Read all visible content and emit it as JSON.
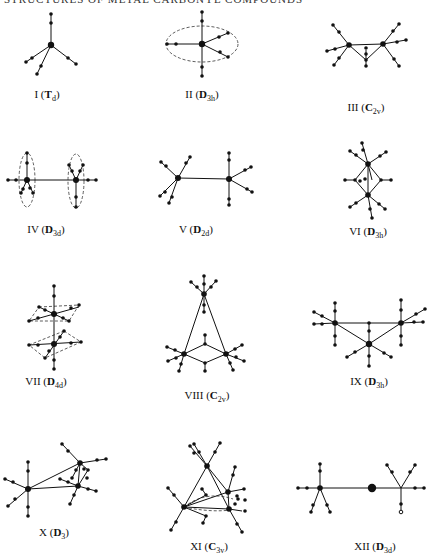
{
  "header": {
    "text": "STRUCTURES OF METAL CARBONYL COMPOUNDS"
  },
  "structures": [
    {
      "id": "I",
      "numeral": "I",
      "group": "T",
      "group_sub": "d",
      "group_bold": true,
      "cx": 47,
      "cy": 95
    },
    {
      "id": "II",
      "numeral": "II",
      "group": "D",
      "group_sub": "3h",
      "group_bold": true,
      "cx": 202,
      "cy": 95
    },
    {
      "id": "III",
      "numeral": "III",
      "group": "C",
      "group_sub": "2v",
      "group_bold": true,
      "cx": 366,
      "cy": 108
    },
    {
      "id": "IV",
      "numeral": "IV",
      "group": "D",
      "group_sub": "3d",
      "group_bold": true,
      "cx": 46,
      "cy": 230
    },
    {
      "id": "V",
      "numeral": "V",
      "group": "D",
      "group_sub": "2d",
      "group_bold": true,
      "cx": 196,
      "cy": 230
    },
    {
      "id": "VI",
      "numeral": "VI",
      "group": "D",
      "group_sub": "3h",
      "group_bold": true,
      "cx": 368,
      "cy": 232
    },
    {
      "id": "VII",
      "numeral": "VII",
      "group": "D",
      "group_sub": "4d",
      "group_bold": true,
      "cx": 46,
      "cy": 382
    },
    {
      "id": "VIII",
      "numeral": "VIII",
      "group": "C",
      "group_sub": "2v",
      "group_bold": true,
      "cx": 207,
      "cy": 396
    },
    {
      "id": "IX",
      "numeral": "IX",
      "group": "D",
      "group_sub": "3h",
      "group_bold": true,
      "cx": 369,
      "cy": 382
    },
    {
      "id": "X",
      "numeral": "X",
      "group": "D",
      "group_sub": "3",
      "group_bold": true,
      "cx": 54,
      "cy": 533
    },
    {
      "id": "XI",
      "numeral": "XI",
      "group": "C",
      "group_sub": "3v",
      "group_bold": true,
      "cx": 209,
      "cy": 547
    },
    {
      "id": "XII",
      "numeral": "XII",
      "group": "D",
      "group_sub": "3d",
      "group_bold": true,
      "cx": 375,
      "cy": 547
    }
  ],
  "colors": {
    "ink": "#111111",
    "background": "#ffffff",
    "dash": "#333333"
  }
}
